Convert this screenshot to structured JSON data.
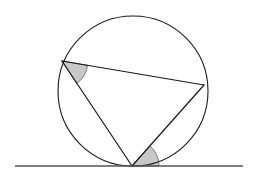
{
  "figure": {
    "kind": "geometry-diagram",
    "canvas": {
      "width": 257,
      "height": 179,
      "background": "#ffffff"
    },
    "colors": {
      "stroke": "#1a1a1a",
      "circle_stroke": "#1a1a1a",
      "tangent_stroke": "#555555",
      "angle_fill": "#c8c8c8",
      "angle_stroke": "#6e6e6e",
      "background": "#ffffff"
    },
    "stroke_widths": {
      "circle": 1.1,
      "chord": 1.2,
      "tangent": 1.6,
      "angle_arc": 0.9
    }
  },
  "circle": {
    "label": "circumscribed-circle",
    "center_x": 133,
    "center_y": 91,
    "radius": 75
  },
  "tangent_line": {
    "label": "tangent-line",
    "x1": 15,
    "y1": 166,
    "x2": 243,
    "y2": 166
  },
  "points": [
    {
      "name": "A",
      "role": "upper-left-vertex-on-circle",
      "x": 62,
      "y": 61
    },
    {
      "name": "B",
      "role": "right-vertex-on-circle",
      "x": 204,
      "y": 85
    },
    {
      "name": "C",
      "role": "bottom-vertex-tangent-point",
      "x": 132,
      "y": 166
    }
  ],
  "segments": [
    {
      "name": "chord-AB",
      "x1": 62,
      "y1": 61,
      "x2": 204,
      "y2": 85
    },
    {
      "name": "chord-AC",
      "x1": 62,
      "y1": 61,
      "x2": 132,
      "y2": 166
    },
    {
      "name": "chord-BC",
      "x1": 204,
      "y1": 85,
      "x2": 132,
      "y2": 166
    }
  ],
  "angle_markers": [
    {
      "name": "angle-at-A",
      "vertex": "A",
      "vertex_x": 62,
      "vertex_y": 61,
      "radius": 26,
      "path": "M 62 61 L 87.6 65.3 A 26 26 0 0 1 76.6 83.5 Z"
    },
    {
      "name": "angle-at-C",
      "vertex": "C",
      "vertex_x": 132,
      "vertex_y": 166,
      "radius": 27,
      "path": "M 132 166 L 159 166 A 27 27 0 0 0 150 145.9 Z"
    }
  ]
}
